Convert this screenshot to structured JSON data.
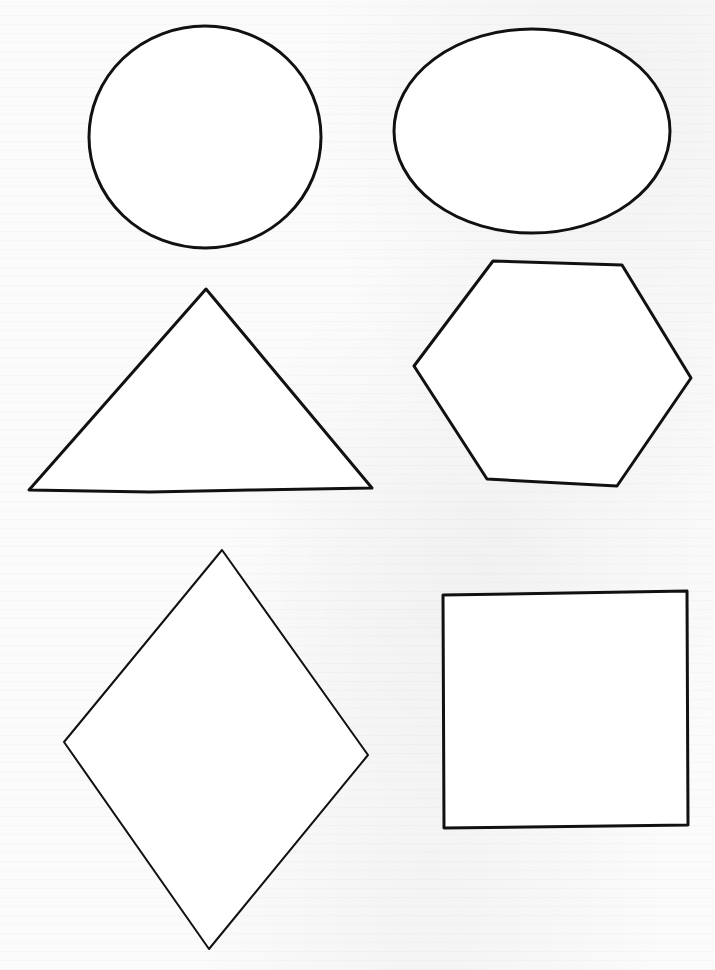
{
  "page": {
    "type": "shapes worksheet",
    "background_color": "#fbfbfb",
    "stroke_color": "#111111"
  },
  "shapes": [
    {
      "name": "circle",
      "label": "Circle",
      "kind": "ellipse",
      "cx": 205,
      "cy": 137,
      "rx": 116,
      "ry": 111,
      "stroke_width": 3
    },
    {
      "name": "oval",
      "label": "Oval",
      "kind": "ellipse",
      "cx": 532,
      "cy": 131,
      "rx": 138,
      "ry": 102,
      "stroke_width": 3
    },
    {
      "name": "triangle",
      "label": "Triangle",
      "kind": "polygon",
      "points": "206,289 372,488 250,490 150,492 29,490",
      "stroke_width": 3
    },
    {
      "name": "hexagon",
      "label": "Hexagon",
      "kind": "polygon",
      "points": "493,261 622,265 691,378 617,486 487,479 414,366",
      "stroke_width": 3
    },
    {
      "name": "diamond",
      "label": "Diamond",
      "kind": "polygon",
      "points": "222,550 368,755 209,949 64,742",
      "stroke_width": 2
    },
    {
      "name": "square",
      "label": "Square",
      "kind": "polygon",
      "points": "443,595 687,591 688,825 444,828",
      "stroke_width": 3
    }
  ]
}
